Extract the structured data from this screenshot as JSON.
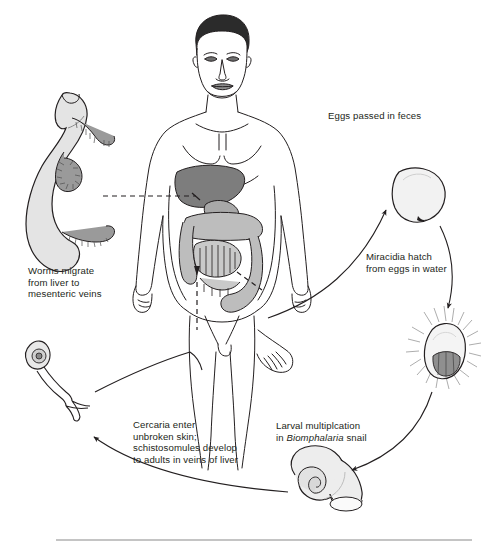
{
  "diagram": {
    "type": "biological-life-cycle",
    "background": "#ffffff",
    "ink": "#231f20",
    "palette": {
      "outline": "#231f20",
      "organ_dark": "#7d7d7d",
      "organ_mid": "#a8a8a8",
      "organ_light": "#d4d4d4",
      "pale": "#efefef",
      "hair": "#2b2b2b",
      "rule": "#8a8a8a"
    },
    "labels": {
      "eggs": "Eggs passed in feces",
      "miracidia": [
        "Miracidia hatch",
        "from eggs in water"
      ],
      "larval_line1": "Larval multiplcation",
      "larval_line2_pre": "in ",
      "larval_line2_italic": "Biomphalaria",
      "larval_line2_post": " snail",
      "cercaria": [
        "Cercaria enter",
        "unbroken skin;",
        "schistosomules develop",
        "to adults in veins of liver"
      ],
      "worms": [
        "Worms migrate",
        "from liver to",
        "mesenteric veins"
      ]
    },
    "stages": [
      {
        "name": "adult-worm-pair",
        "caption": "Worms migrate from liver to mesenteric veins"
      },
      {
        "name": "egg",
        "caption": "Eggs passed in feces"
      },
      {
        "name": "miracidium",
        "caption": "Miracidia hatch from eggs in water"
      },
      {
        "name": "snail",
        "caption": "Larval multiplcation in Biomphalaria snail"
      },
      {
        "name": "cercaria",
        "caption": "Cercaria enter unbroken skin; schistosomules develop to adults in veins of liver"
      },
      {
        "name": "human-host",
        "caption": "Human definitive host"
      }
    ]
  }
}
